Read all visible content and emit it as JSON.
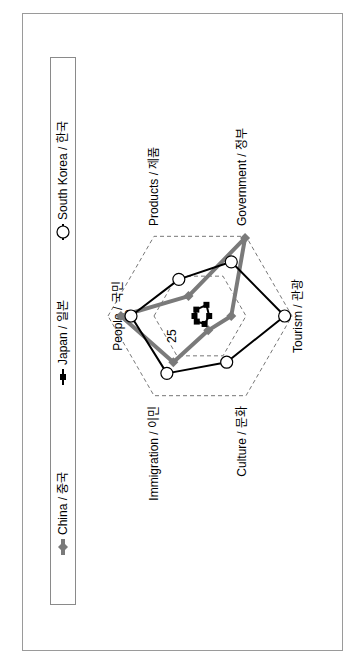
{
  "chart_data": {
    "type": "radar",
    "orientation": "rotated-90-ccw",
    "title": "",
    "axes": [
      {
        "key": "people",
        "label": "People / 국민"
      },
      {
        "key": "products",
        "label": "Products / 제품"
      },
      {
        "key": "government",
        "label": "Government / 정부"
      },
      {
        "key": "tourism",
        "label": "Tourism / 관광"
      },
      {
        "key": "culture",
        "label": "Culture / 문화"
      },
      {
        "key": "immigration",
        "label": "Immigration / 이민"
      }
    ],
    "range": [
      0,
      50
    ],
    "gridlines": [
      25,
      50
    ],
    "tick_labels": [
      "25",
      "50"
    ],
    "series": [
      {
        "name": "China / 중국",
        "marker": "diamond",
        "color": "#7a7a7a",
        "line_width": 4,
        "values": [
          43,
          12.5,
          49,
          17,
          9,
          29
        ]
      },
      {
        "name": "Japan / 일본",
        "marker": "square",
        "color": "#000000",
        "line_width": 2,
        "values": [
          3,
          4,
          7,
          5,
          5,
          3.5
        ]
      },
      {
        "name": "South Korea / 한국",
        "marker": "circle-open",
        "color": "#000000",
        "line_width": 2,
        "values": [
          37.5,
          23,
          34,
          46,
          29,
          36
        ]
      }
    ],
    "legend": {
      "position": "left",
      "items": [
        "China / 중국",
        "Japan / 일본",
        "South Korea / 한국"
      ]
    },
    "grid": "dashed-hexagon"
  }
}
